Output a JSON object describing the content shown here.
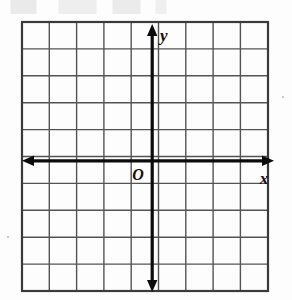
{
  "figure": {
    "kind": "coordinate-plane",
    "origin_label": "O",
    "x_axis_label": "x",
    "y_axis_label": "y"
  },
  "grid": {
    "columns": 9,
    "rows": 10,
    "cell_width": 27.3,
    "cell_height": 26.9,
    "left": 22,
    "top": 22,
    "right": 268,
    "bottom": 291,
    "line_color": "#4a4a4a",
    "border_color": "#3a3a3a",
    "background": "#fdfdfd"
  },
  "axes": {
    "color": "#0b0b0b",
    "stroke_width": 3,
    "x_axis_y": 161,
    "y_axis_x": 152,
    "x_axis_left_end": 22,
    "x_axis_right_end": 274,
    "y_axis_top_end": 24,
    "y_axis_bottom_end": 292,
    "arrowheads": [
      "left",
      "right",
      "up",
      "down"
    ]
  },
  "artifact": {
    "top_smudge": true,
    "specks": [
      {
        "x": 7,
        "y": 236
      },
      {
        "x": 282,
        "y": 96
      }
    ]
  }
}
